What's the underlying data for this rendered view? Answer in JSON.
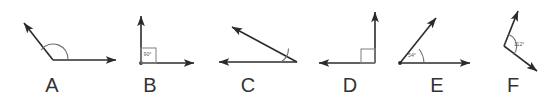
{
  "sheet": {
    "title": "Angle diagrams A through F",
    "width": 553,
    "height": 99,
    "background_color": "#ffffff",
    "line_color": "#2b2b2b",
    "mark_color": "#6e6e6e",
    "label_color": "#333333"
  },
  "figures": [
    {
      "id": "A",
      "letter": "A",
      "letter_x": 52,
      "letter_y": 92,
      "angle_label": "",
      "marker": "arc",
      "vertex": [
        53,
        60
      ],
      "rays": [
        {
          "name": "ray-right",
          "to": [
            116,
            60
          ],
          "arrow": true
        },
        {
          "name": "ray-upper-left",
          "to": [
            22,
            21
          ],
          "arrow": true
        }
      ],
      "arc": "M 41 50 A 15 15 0 0 1 68 60",
      "description": "obtuse angle opening upward, arc marked"
    },
    {
      "id": "B",
      "letter": "B",
      "letter_x": 150,
      "letter_y": 92,
      "angle_label": "90°",
      "angle_label_x": 147,
      "angle_label_y": 56,
      "marker": "box",
      "vertex": [
        141,
        63
      ],
      "rays": [
        {
          "name": "ray-up",
          "to": [
            141,
            14
          ],
          "arrow": true
        },
        {
          "name": "ray-right",
          "to": [
            196,
            63
          ],
          "arrow": true
        }
      ],
      "box": {
        "x": 141,
        "y": 48,
        "w": 15,
        "h": 15
      },
      "description": "right angle with boxed 90 degree label"
    },
    {
      "id": "C",
      "letter": "C",
      "letter_x": 248,
      "letter_y": 92,
      "angle_label": "",
      "marker": "arc",
      "vertex": [
        297,
        62
      ],
      "rays": [
        {
          "name": "ray-left",
          "to": [
            217,
            62
          ],
          "arrow": true
        },
        {
          "name": "ray-upper-left",
          "to": [
            230,
            25
          ],
          "arrow": true
        }
      ],
      "arc": "M 283 62 A 14 14 0 0 1 288 51",
      "description": "acute angle opening to the left"
    },
    {
      "id": "D",
      "letter": "D",
      "letter_x": 350,
      "letter_y": 92,
      "angle_label": "",
      "marker": "box",
      "vertex": [
        375,
        63
      ],
      "rays": [
        {
          "name": "ray-up",
          "to": [
            375,
            10
          ],
          "arrow": true
        },
        {
          "name": "ray-left",
          "to": [
            317,
            63
          ],
          "arrow": true
        }
      ],
      "box": {
        "x": 361,
        "y": 49,
        "w": 14,
        "h": 14
      },
      "description": "right angle opening to the upper left, square marker"
    },
    {
      "id": "E",
      "letter": "E",
      "letter_x": 437,
      "letter_y": 92,
      "angle_label": "54°",
      "angle_label_x": 413,
      "angle_label_y": 56,
      "marker": "arc",
      "vertex": [
        400,
        63
      ],
      "rays": [
        {
          "name": "ray-right",
          "to": [
            472,
            63
          ],
          "arrow": true
        },
        {
          "name": "ray-upper-right",
          "to": [
            438,
            16
          ],
          "arrow": true
        }
      ],
      "arc": "M 421 51 A 24 24 0 0 1 424 63",
      "description": "acute 54 degree angle opening to the right"
    },
    {
      "id": "F",
      "letter": "F",
      "letter_x": 513,
      "letter_y": 92,
      "angle_label": "112°",
      "angle_label_x": 512,
      "angle_label_y": 45,
      "marker": "arc",
      "vertex": [
        504,
        46
      ],
      "rays": [
        {
          "name": "ray-upper-right",
          "to": [
            519,
            9
          ],
          "arrow": true
        },
        {
          "name": "ray-lower-right",
          "to": [
            539,
            73
          ],
          "arrow": true
        }
      ],
      "arc": "M 508 34 A 13 13 0 0 1 513 53",
      "description": "obtuse 112 degree angle opening to the right"
    }
  ]
}
